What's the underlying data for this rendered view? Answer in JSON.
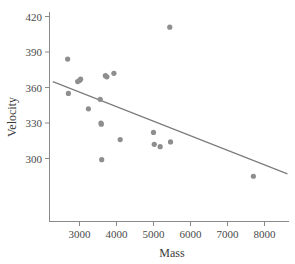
{
  "chart_data": {
    "type": "scatter",
    "title": "",
    "xlabel": "Mass",
    "ylabel": "Velocity",
    "xlim": [
      2200,
      8700
    ],
    "ylim": [
      278,
      428
    ],
    "grid": false,
    "legend": null,
    "x_ticks": [
      3000,
      4000,
      5000,
      6000,
      7000,
      8000
    ],
    "x_tick_labels": [
      "3000",
      "4000",
      "5000",
      "6000",
      "7000",
      "8000"
    ],
    "y_ticks": [
      300,
      330,
      360,
      390,
      420
    ],
    "y_tick_labels": [
      "300",
      "330",
      "360",
      "390",
      "420"
    ],
    "point_color": "#8e8e8e",
    "line_color": "#7c7c7c",
    "axis_color": "#8a8a8a",
    "series": [
      {
        "name": "observations",
        "x": [
          2680,
          2700,
          2950,
          3000,
          3030,
          3240,
          3560,
          3580,
          3590,
          3600,
          3700,
          3740,
          3930,
          4100,
          5000,
          5020,
          5180,
          5440,
          5460,
          7700
        ],
        "y": [
          384,
          355,
          365,
          366,
          367,
          342,
          350,
          330,
          329,
          299,
          370,
          369,
          372,
          316,
          322,
          312,
          310,
          411,
          314,
          285
        ]
      }
    ],
    "trend_line": {
      "label": "fitted line",
      "x_start": 2280,
      "y_start": 365,
      "x_end": 8620,
      "y_end": 287
    }
  }
}
